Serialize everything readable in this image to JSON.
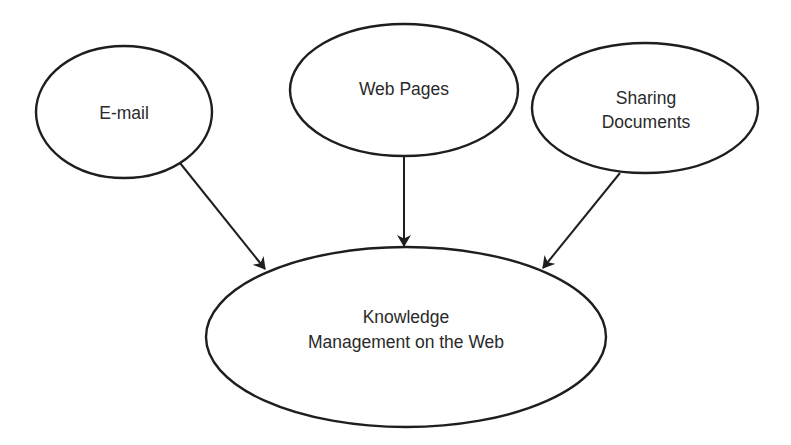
{
  "diagram": {
    "type": "concept-flow",
    "background": "#ffffff",
    "stroke_color": "#1e1e1e",
    "nodes": [
      {
        "id": "email",
        "lines": [
          "E-mail"
        ]
      },
      {
        "id": "web_pages",
        "lines": [
          "Web Pages"
        ]
      },
      {
        "id": "sharing_documents",
        "lines": [
          "Sharing",
          "Documents"
        ]
      },
      {
        "id": "km_web",
        "lines": [
          "Knowledge",
          "Management on the Web"
        ]
      }
    ],
    "edges": [
      {
        "from": "email",
        "to": "km_web"
      },
      {
        "from": "web_pages",
        "to": "km_web"
      },
      {
        "from": "sharing_documents",
        "to": "km_web"
      }
    ]
  }
}
